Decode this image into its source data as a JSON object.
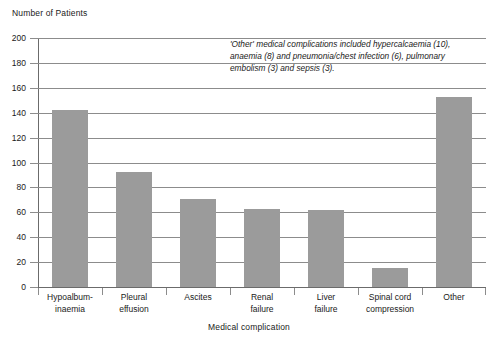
{
  "chart_data": {
    "type": "bar",
    "title": "",
    "ylabel": "Number of Patients",
    "xlabel": "Medical complication",
    "categories": [
      "Hypoalbum-\ninaemia",
      "Pleural\neffusion",
      "Ascites",
      "Renal\nfailure",
      "Liver\nfailure",
      "Spinal cord\ncompression",
      "Other"
    ],
    "category_lines": [
      [
        "Hypoalbum-",
        "inaemia"
      ],
      [
        "Pleural",
        "effusion"
      ],
      [
        "Ascites",
        ""
      ],
      [
        "Renal",
        "failure"
      ],
      [
        "Liver",
        "failure"
      ],
      [
        "Spinal cord",
        "compression"
      ],
      [
        "Other",
        ""
      ]
    ],
    "values": [
      142,
      92,
      71,
      63,
      62,
      15,
      153
    ],
    "ylim": [
      0,
      200
    ],
    "ytick_step": 20,
    "ytick_labels": [
      "0",
      "20",
      "40",
      "60",
      "80",
      "100",
      "120",
      "140",
      "160",
      "180",
      "200"
    ],
    "grid": true,
    "legend": "none",
    "bar_color": "#9b9b9b",
    "grid_color": "#8c8c8c",
    "axis_color": "#6b6b6b",
    "annotation_lines": [
      "'Other' medical complications included hypercalcaemia (10),",
      "anaemia (8) and pneumonia/chest infection (6), pulmonary",
      "embolism (3) and sepsis (3)."
    ]
  }
}
